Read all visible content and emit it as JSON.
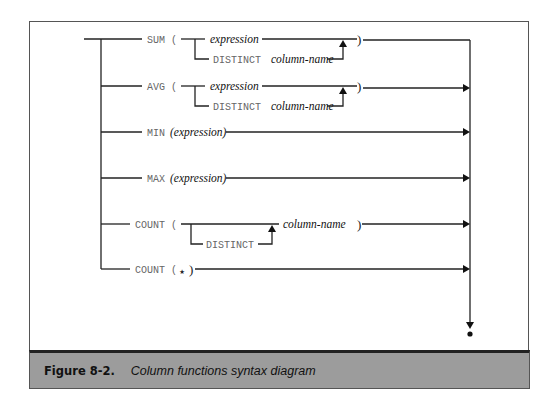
{
  "figure": {
    "number": "Figure 8-2.",
    "title": "Column functions syntax diagram"
  },
  "diagram": {
    "rows": [
      {
        "id": "sum",
        "keyword": "SUM (",
        "branch_main": "expression",
        "branch_alt_keyword": "DISTINCT",
        "branch_alt_arg": "column-name",
        "close": ")"
      },
      {
        "id": "avg",
        "keyword": "AVG (",
        "branch_main": "expression",
        "branch_alt_keyword": "DISTINCT",
        "branch_alt_arg": "column-name",
        "close": ")"
      },
      {
        "id": "min",
        "keyword": "MIN",
        "arg": "(expression)"
      },
      {
        "id": "max",
        "keyword": "MAX",
        "arg": "(expression)"
      },
      {
        "id": "count",
        "keyword": "COUNT (",
        "branch_alt_keyword": "DISTINCT",
        "arg": "column-name",
        "close": ")"
      },
      {
        "id": "count-star",
        "keyword": "COUNT (",
        "star": "⋆",
        "close": ")"
      }
    ]
  }
}
